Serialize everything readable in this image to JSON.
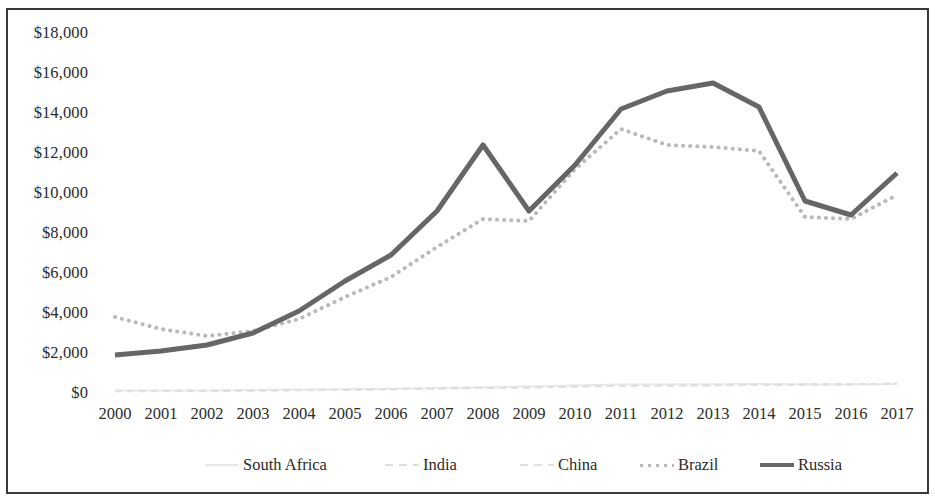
{
  "chart_data": {
    "type": "line",
    "title": "",
    "subtitle": "",
    "xlabel": "",
    "ylabel": "",
    "x": [
      2000,
      2001,
      2002,
      2003,
      2004,
      2005,
      2006,
      2007,
      2008,
      2009,
      2010,
      2011,
      2012,
      2013,
      2014,
      2015,
      2016,
      2017
    ],
    "categories": [
      "2000",
      "2001",
      "2002",
      "2003",
      "2004",
      "2005",
      "2006",
      "2007",
      "2008",
      "2009",
      "2010",
      "2011",
      "2012",
      "2013",
      "2014",
      "2015",
      "2016",
      "2017"
    ],
    "xlim": [
      2000,
      2017
    ],
    "ylim": [
      0,
      18000
    ],
    "ytick_values": [
      0,
      2000,
      4000,
      6000,
      8000,
      10000,
      12000,
      14000,
      16000,
      18000
    ],
    "ytick_labels": [
      "$0",
      "$2,000",
      "$4,000",
      "$6,000",
      "$8,000",
      "$10,000",
      "$12,000",
      "$14,000",
      "$16,000",
      "$18,000"
    ],
    "grid": false,
    "legend_position": "bottom",
    "series": [
      {
        "name": "South Africa",
        "color": "#e8e8e8",
        "style": "solid",
        "width": 2,
        "values": [
          120,
          130,
          125,
          145,
          170,
          190,
          215,
          250,
          290,
          320,
          380,
          420,
          430,
          440,
          450,
          420,
          430,
          450
        ]
      },
      {
        "name": "India",
        "color": "#dcdcdc",
        "style": "dashed",
        "width": 2,
        "values": [
          100,
          105,
          112,
          125,
          145,
          165,
          190,
          230,
          250,
          280,
          330,
          360,
          370,
          380,
          400,
          410,
          430,
          460
        ]
      },
      {
        "name": "China",
        "color": "#e0e0e0",
        "style": "dashed",
        "width": 2,
        "values": [
          90,
          95,
          105,
          118,
          135,
          155,
          180,
          215,
          245,
          270,
          320,
          355,
          375,
          395,
          420,
          430,
          445,
          470
        ]
      },
      {
        "name": "Brazil",
        "color": "#b9b9b9",
        "style": "dotted",
        "width": 4,
        "values": [
          3800,
          3200,
          2850,
          3100,
          3700,
          4800,
          5800,
          7300,
          8700,
          8600,
          11200,
          13200,
          12400,
          12300,
          12100,
          8800,
          8700,
          9900
        ]
      },
      {
        "name": "Russia",
        "color": "#666666",
        "style": "solid",
        "width": 5,
        "values": [
          1900,
          2100,
          2400,
          3000,
          4100,
          5600,
          6900,
          9100,
          12400,
          9100,
          11400,
          14200,
          15100,
          15500,
          14300,
          9600,
          8900,
          11000
        ]
      }
    ]
  },
  "legend": {
    "items": [
      {
        "label": "South Africa"
      },
      {
        "label": "India"
      },
      {
        "label": "China"
      },
      {
        "label": "Brazil"
      },
      {
        "label": "Russia"
      }
    ]
  }
}
